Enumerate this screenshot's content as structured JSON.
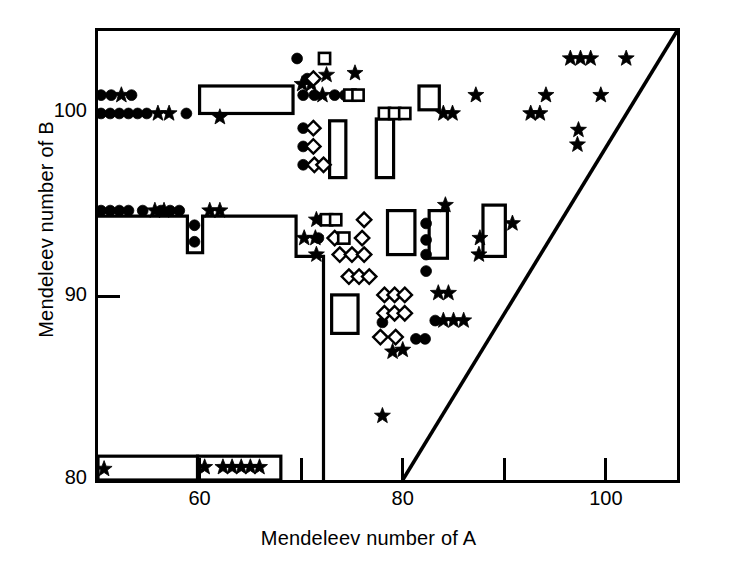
{
  "figure": {
    "xlabel": "Mendeleev number of A",
    "ylabel": "Mendeleev number of B",
    "line_color": "#000000",
    "bg_color": "#ffffff"
  },
  "chart_data": {
    "type": "scatter",
    "title": "",
    "xlabel": "Mendeleev number of A",
    "ylabel": "Mendeleev number of B",
    "xlim": [
      50,
      107
    ],
    "ylim": [
      80,
      104.5
    ],
    "xticks": [
      60,
      70,
      80,
      90,
      100
    ],
    "xticklabels": [
      "60",
      "",
      "80",
      "",
      "100"
    ],
    "yticks": [
      80,
      90,
      100
    ],
    "yticklabels": [
      "80",
      "90",
      "100"
    ],
    "grid": false,
    "legend": "none",
    "series": [
      {
        "name": "filled-circle",
        "marker": "circle",
        "fill": "#000000",
        "points": [
          [
            50.3,
            101.0
          ],
          [
            51.3,
            101.0
          ],
          [
            53.3,
            101.0
          ],
          [
            50.3,
            100.0
          ],
          [
            51.2,
            100.0
          ],
          [
            52.1,
            100.0
          ],
          [
            53.0,
            100.0
          ],
          [
            53.9,
            100.0
          ],
          [
            54.8,
            100.0
          ],
          [
            58.7,
            100.0
          ],
          [
            69.6,
            103.0
          ],
          [
            70.6,
            101.9
          ],
          [
            70.2,
            101.0
          ],
          [
            71.3,
            101.0
          ],
          [
            73.3,
            101.0
          ],
          [
            74.3,
            101.0
          ],
          [
            70.2,
            99.2
          ],
          [
            70.2,
            98.2
          ],
          [
            70.2,
            97.2
          ],
          [
            50.3,
            94.7
          ],
          [
            51.2,
            94.7
          ],
          [
            52.1,
            94.7
          ],
          [
            53.0,
            94.7
          ],
          [
            54.4,
            94.7
          ],
          [
            56.2,
            94.7
          ],
          [
            57.1,
            94.7
          ],
          [
            58.0,
            94.7
          ],
          [
            59.5,
            93.9
          ],
          [
            59.5,
            93.0
          ],
          [
            72.0,
            94.2
          ],
          [
            71.7,
            93.2
          ],
          [
            82.3,
            94.0
          ],
          [
            82.3,
            93.1
          ],
          [
            82.3,
            92.3
          ],
          [
            82.3,
            91.4
          ],
          [
            78.0,
            88.6
          ],
          [
            83.2,
            88.7
          ],
          [
            81.3,
            87.7
          ],
          [
            82.2,
            87.7
          ]
        ]
      },
      {
        "name": "filled-star",
        "marker": "star",
        "fill": "#000000",
        "points": [
          [
            52.3,
            101.0
          ],
          [
            55.9,
            100.0
          ],
          [
            57.0,
            100.0
          ],
          [
            62.0,
            99.8
          ],
          [
            72.5,
            102.1
          ],
          [
            75.3,
            102.2
          ],
          [
            70.1,
            101.6
          ],
          [
            71.0,
            101.6
          ],
          [
            72.1,
            101.0
          ],
          [
            87.2,
            101.0
          ],
          [
            84.0,
            100.0
          ],
          [
            84.9,
            100.0
          ],
          [
            96.5,
            103.0
          ],
          [
            97.5,
            103.0
          ],
          [
            98.5,
            103.0
          ],
          [
            102.0,
            103.0
          ],
          [
            94.1,
            101.0
          ],
          [
            99.5,
            101.0
          ],
          [
            92.6,
            100.0
          ],
          [
            93.5,
            100.0
          ],
          [
            97.3,
            99.1
          ],
          [
            97.2,
            98.3
          ],
          [
            55.6,
            94.7
          ],
          [
            56.5,
            94.7
          ],
          [
            61.0,
            94.7
          ],
          [
            62.0,
            94.7
          ],
          [
            71.5,
            94.2
          ],
          [
            70.3,
            93.2
          ],
          [
            71.4,
            93.2
          ],
          [
            71.5,
            92.3
          ],
          [
            84.2,
            95.0
          ],
          [
            87.6,
            93.2
          ],
          [
            87.5,
            92.3
          ],
          [
            90.8,
            94.0
          ],
          [
            83.5,
            90.2
          ],
          [
            84.5,
            90.2
          ],
          [
            84.0,
            88.7
          ],
          [
            85.0,
            88.7
          ],
          [
            86.0,
            88.7
          ],
          [
            79.0,
            87.0
          ],
          [
            80.0,
            87.1
          ],
          [
            78.0,
            83.5
          ],
          [
            50.6,
            80.6
          ],
          [
            60.5,
            80.7
          ],
          [
            62.3,
            80.7
          ],
          [
            63.2,
            80.7
          ],
          [
            64.1,
            80.7
          ],
          [
            65.0,
            80.7
          ],
          [
            65.9,
            80.7
          ]
        ]
      },
      {
        "name": "open-diamond",
        "marker": "diamond",
        "fill": "#ffffff",
        "points": [
          [
            71.2,
            101.9
          ],
          [
            71.2,
            99.2
          ],
          [
            71.2,
            98.2
          ],
          [
            71.3,
            97.2
          ],
          [
            72.2,
            97.2
          ],
          [
            76.2,
            94.2
          ],
          [
            73.3,
            93.2
          ],
          [
            76.0,
            93.2
          ],
          [
            73.8,
            92.3
          ],
          [
            75.0,
            92.3
          ],
          [
            76.2,
            92.3
          ],
          [
            74.7,
            91.1
          ],
          [
            75.7,
            91.1
          ],
          [
            76.7,
            91.1
          ],
          [
            78.2,
            90.1
          ],
          [
            79.2,
            90.1
          ],
          [
            80.2,
            90.1
          ],
          [
            78.2,
            89.1
          ],
          [
            79.2,
            89.1
          ],
          [
            80.2,
            89.1
          ],
          [
            77.8,
            87.8
          ],
          [
            79.3,
            87.8
          ]
        ]
      },
      {
        "name": "open-square",
        "marker": "square",
        "fill": "#ffffff",
        "points": [
          [
            72.3,
            103.0
          ],
          [
            74.8,
            101.0
          ],
          [
            75.6,
            101.0
          ],
          [
            72.5,
            94.2
          ],
          [
            73.4,
            94.2
          ],
          [
            74.2,
            93.2
          ],
          [
            78.2,
            100.0
          ],
          [
            79.2,
            100.0
          ],
          [
            80.2,
            100.0
          ]
        ]
      }
    ],
    "boxes": [
      {
        "name": "box-upper-left-wide",
        "x0": 60.0,
        "x1": 69.2,
        "y0": 100.0,
        "y1": 101.5
      },
      {
        "name": "box-upper-mid-tall",
        "x0": 72.8,
        "x1": 74.4,
        "y0": 96.5,
        "y1": 99.6
      },
      {
        "name": "box-upper-right-tall",
        "x0": 77.4,
        "x1": 79.1,
        "y0": 96.5,
        "y1": 99.7
      },
      {
        "name": "box-upper-small",
        "x0": 81.6,
        "x1": 83.6,
        "y0": 100.2,
        "y1": 101.5
      },
      {
        "name": "box-mid-a",
        "x0": 78.5,
        "x1": 81.2,
        "y0": 92.3,
        "y1": 94.7
      },
      {
        "name": "box-mid-b",
        "x0": 82.6,
        "x1": 84.4,
        "y0": 92.1,
        "y1": 94.7
      },
      {
        "name": "box-mid-c",
        "x0": 87.9,
        "x1": 90.1,
        "y0": 92.2,
        "y1": 95.0
      },
      {
        "name": "box-lower-mid",
        "x0": 73.0,
        "x1": 75.6,
        "y0": 88.0,
        "y1": 90.1
      },
      {
        "name": "box-bottom-left",
        "x0": 50.0,
        "x1": 59.8,
        "y0": 80.0,
        "y1": 81.3
      },
      {
        "name": "box-bottom-right",
        "x0": 59.8,
        "x1": 68.0,
        "y0": 80.0,
        "y1": 81.3
      }
    ],
    "step_boundary": {
      "name": "phase-boundary-step",
      "points": [
        [
          50.0,
          94.4
        ],
        [
          58.8,
          94.4
        ],
        [
          58.8,
          92.4
        ],
        [
          60.3,
          92.4
        ],
        [
          60.3,
          94.4
        ],
        [
          69.5,
          94.4
        ],
        [
          69.5,
          92.2
        ],
        [
          72.2,
          92.2
        ],
        [
          72.2,
          80.0
        ]
      ]
    },
    "diagonal_line": {
      "name": "diagonal-boundary",
      "from": [
        80.0,
        80.0
      ],
      "to": [
        107.0,
        104.5
      ]
    },
    "annotations": []
  }
}
